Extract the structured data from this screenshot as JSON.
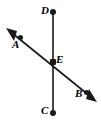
{
  "figure": {
    "kind": "geometry-diagram",
    "background_color": "#ffffff",
    "stroke_color": "#1a1a1a",
    "label_color": "#000000",
    "width": 101,
    "height": 125,
    "labels": {
      "D": "D",
      "A": "A",
      "E": "E",
      "B": "B",
      "C": "C"
    },
    "points": [
      {
        "name": "D",
        "label": "D",
        "x": 53,
        "y": 12,
        "marker": "filled-dot",
        "label_position": "left"
      },
      {
        "name": "A",
        "label": "A",
        "x": 20,
        "y": 38,
        "marker": "filled-dot",
        "label_position": "below-left"
      },
      {
        "name": "E",
        "label": "E",
        "x": 53,
        "y": 62,
        "marker": "filled-dot",
        "label_position": "upper-right"
      },
      {
        "name": "B",
        "label": "B",
        "x": 86,
        "y": 92,
        "marker": "filled-dot",
        "label_position": "below-left"
      },
      {
        "name": "C",
        "label": "C",
        "x": 53,
        "y": 113,
        "marker": "filled-dot",
        "label_position": "left"
      }
    ],
    "segments": [
      {
        "name": "segment-CD",
        "from": "D",
        "to": "C",
        "x1": 53,
        "y1": 12,
        "x2": 53,
        "y2": 113,
        "arrow_start": false,
        "arrow_end": false,
        "endpoint_markers": [
          "D",
          "C"
        ]
      },
      {
        "name": "line-AB",
        "from": "A",
        "to": "B",
        "x1": 8,
        "y1": 30,
        "x2": 95,
        "y2": 100,
        "arrow_start": true,
        "arrow_end": true,
        "passes_through": "E"
      }
    ],
    "intersection": {
      "name": "E",
      "x": 53,
      "y": 62,
      "of": [
        "segment-CD",
        "line-AB"
      ]
    }
  }
}
